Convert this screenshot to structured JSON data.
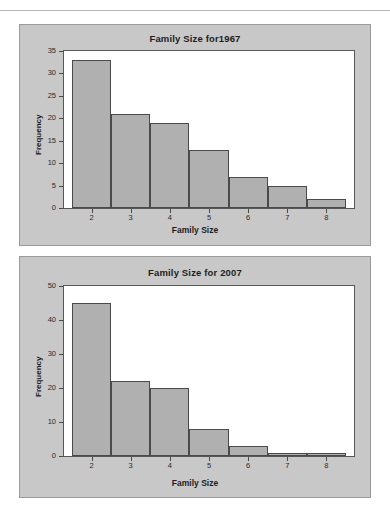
{
  "page": {
    "background_color": "#ffffff",
    "panel_color": "#c8c8c8",
    "plot_background_color": "#ffffff",
    "bar_fill_color": "#b0b0b0",
    "bar_edge_color": "#4a4a4a"
  },
  "charts": [
    {
      "title": "Family Size for1967",
      "xlabel": "Family Size",
      "ylabel": "Frequency",
      "yticks": [
        "0",
        "5",
        "10",
        "15",
        "20",
        "25",
        "30",
        "35"
      ],
      "xticks": [
        "2",
        "3",
        "4",
        "5",
        "6",
        "7",
        "8"
      ],
      "ylim": [
        0,
        35
      ]
    },
    {
      "title": "Family Size for 2007",
      "xlabel": "Family Size",
      "ylabel": "Frequency",
      "yticks": [
        "0",
        "10",
        "20",
        "30",
        "40",
        "50"
      ],
      "xticks": [
        "2",
        "3",
        "4",
        "5",
        "6",
        "7",
        "8"
      ],
      "ylim": [
        0,
        50
      ]
    }
  ],
  "chart_data": [
    {
      "type": "bar",
      "title": "Family Size for1967",
      "xlabel": "Family Size",
      "ylabel": "Frequency",
      "categories": [
        "2",
        "3",
        "4",
        "5",
        "6",
        "7",
        "8"
      ],
      "values": [
        33,
        21,
        19,
        13,
        7,
        5,
        2
      ],
      "ylim": [
        0,
        35
      ],
      "ytick_values": [
        0,
        5,
        10,
        15,
        20,
        25,
        30,
        35
      ],
      "grid": false,
      "legend": "none"
    },
    {
      "type": "bar",
      "title": "Family Size for 2007",
      "xlabel": "Family Size",
      "ylabel": "Frequency",
      "categories": [
        "2",
        "3",
        "4",
        "5",
        "6",
        "7",
        "8"
      ],
      "values": [
        45,
        22,
        20,
        8,
        3,
        1,
        1
      ],
      "ylim": [
        0,
        50
      ],
      "ytick_values": [
        0,
        10,
        20,
        30,
        40,
        50
      ],
      "grid": false,
      "legend": "none"
    }
  ]
}
